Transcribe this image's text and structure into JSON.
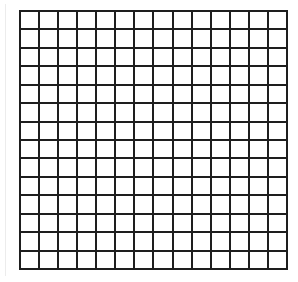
{
  "board": {
    "rows": 14,
    "cols": 14,
    "line_color": "#1e1e1e",
    "cell_color": "#ffffff",
    "cells_filled": []
  }
}
